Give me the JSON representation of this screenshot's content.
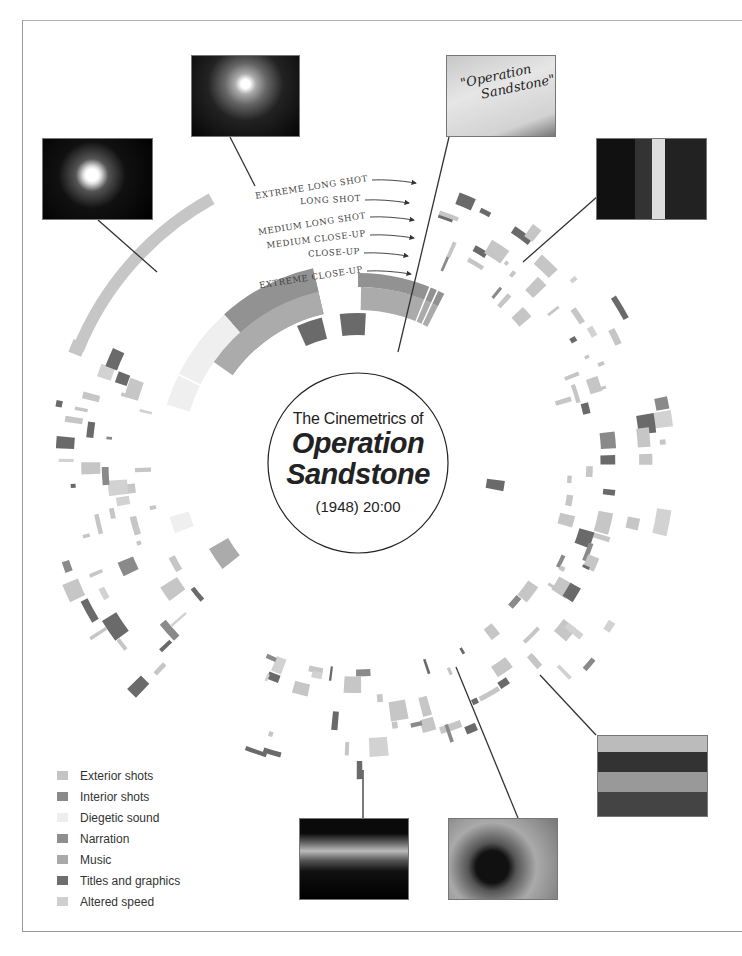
{
  "title": {
    "line1": "The Cinemetrics of",
    "line2": "Operation",
    "line3": "Sandstone",
    "year_duration": "(1948) 20:00"
  },
  "shot_scale_labels": [
    {
      "label": "EXTREME LONG SHOT",
      "x": 406,
      "y": 183
    },
    {
      "label": "LONG SHOT",
      "x": 399,
      "y": 203
    },
    {
      "label": "MEDIUM LONG SHOT",
      "x": 404,
      "y": 220
    },
    {
      "label": "MEDIUM CLOSE-UP",
      "x": 404,
      "y": 238
    },
    {
      "label": "CLOSE-UP",
      "x": 398,
      "y": 256
    },
    {
      "label": "EXTREME CLOSE-UP",
      "x": 401,
      "y": 274
    }
  ],
  "legend": [
    {
      "label": "Exterior shots",
      "color": "#c4c4c4"
    },
    {
      "label": "Interior shots",
      "color": "#8a8a8a"
    },
    {
      "label": "Diegetic sound",
      "color": "#eeeeee"
    },
    {
      "label": "Narration",
      "color": "#8e8e8e"
    },
    {
      "label": "Music",
      "color": "#a9a9a9"
    },
    {
      "label": "Titles and graphics",
      "color": "#6e6e6e"
    },
    {
      "label": "Altered speed",
      "color": "#cfcfcf"
    }
  ],
  "colors": {
    "exterior": "#c6c6c6",
    "interior": "#8a8a8a",
    "diegetic": "#efefef",
    "narration": "#929292",
    "music": "#ababab",
    "titles": "#6a6a6a",
    "speed": "#d2d2d2",
    "line": "#333333"
  },
  "photos": [
    {
      "name": "photo-atomic-blast-night",
      "x": 42,
      "y": 138,
      "w": 111,
      "h": 82,
      "style": "blast"
    },
    {
      "name": "photo-explosion-cloud",
      "x": 191,
      "y": 55,
      "w": 109,
      "h": 82,
      "style": "cloud"
    },
    {
      "name": "photo-title-card",
      "x": 446,
      "y": 55,
      "w": 110,
      "h": 82,
      "style": "card",
      "caption1": "\"Operation",
      "caption2": "Sandstone\""
    },
    {
      "name": "photo-lab-technician",
      "x": 596,
      "y": 138,
      "w": 111,
      "h": 82,
      "style": "lab"
    },
    {
      "name": "photo-crew-on-deck",
      "x": 597,
      "y": 735,
      "w": 111,
      "h": 82,
      "style": "crew"
    },
    {
      "name": "photo-equipment-closeup",
      "x": 448,
      "y": 818,
      "w": 110,
      "h": 82,
      "style": "equip"
    },
    {
      "name": "photo-horizon-sunset",
      "x": 299,
      "y": 818,
      "w": 110,
      "h": 82,
      "style": "horizon"
    }
  ],
  "connector_lines": [
    {
      "x1": 98,
      "y1": 220,
      "x2": 157,
      "y2": 272
    },
    {
      "x1": 230,
      "y1": 137,
      "x2": 255,
      "y2": 186
    },
    {
      "x1": 449,
      "y1": 137,
      "x2": 398,
      "y2": 352
    },
    {
      "x1": 598,
      "y1": 196,
      "x2": 523,
      "y2": 262
    },
    {
      "x1": 596,
      "y1": 735,
      "x2": 540,
      "y2": 675
    },
    {
      "x1": 518,
      "y1": 818,
      "x2": 456,
      "y2": 667
    },
    {
      "x1": 363,
      "y1": 818,
      "x2": 363,
      "y2": 770
    }
  ],
  "chart_data": {
    "type": "radial-timeline",
    "title": "The Cinemetrics of Operation Sandstone",
    "subtitle": "(1948) 20:00",
    "duration": "20:00",
    "center": [
      358,
      463
    ],
    "inner_circle_radius": 90,
    "rings": [
      {
        "name": "Narration",
        "r_in": 153,
        "r_out": 176,
        "segments": [
          [
            0,
            30,
            "narration"
          ],
          [
            31,
            200,
            "narration"
          ],
          [
            200,
            268,
            "narration"
          ],
          [
            268,
            358,
            "narration"
          ]
        ],
        "gaps_deg": [
          22,
          24,
          46,
          50,
          55,
          56,
          70,
          96,
          117,
          147,
          150,
          157,
          166,
          196,
          203,
          256,
          270,
          292,
          302
        ]
      },
      {
        "name": "Titles and graphics",
        "r_in": 130,
        "r_out": 150,
        "segments": [
          [
            346,
            358,
            "titles"
          ],
          [
            0,
            10,
            "titles"
          ],
          [
            98,
            101,
            "titles"
          ]
        ]
      },
      {
        "name": "Music",
        "r_in": 153,
        "r_out": 176,
        "segments": [
          [
            304,
            344,
            "music"
          ],
          [
            2,
            30,
            "music"
          ],
          [
            232,
            240,
            "music"
          ]
        ],
        "offset_band": [
          153,
          176
        ]
      },
      {
        "name": "Diegetic sound",
        "r_in": 178,
        "r_out": 200,
        "segments": [
          [
            286,
            328,
            "diegetic"
          ],
          [
            248,
            255,
            "diegetic"
          ]
        ]
      },
      {
        "name": "Exterior shots (extreme long)",
        "r_in": 296,
        "r_out": 308,
        "segments": [
          [
            293,
            330,
            "exterior"
          ]
        ]
      }
    ],
    "legend": [
      "Exterior shots",
      "Interior shots",
      "Diegetic sound",
      "Narration",
      "Music",
      "Titles and graphics",
      "Altered speed"
    ],
    "shot_scale_radii": {
      "EXTREME LONG SHOT": 300,
      "LONG SHOT": 280,
      "MEDIUM LONG SHOT": 262,
      "MEDIUM CLOSE-UP": 245,
      "CLOSE-UP": 228,
      "EXTREME CLOSE-UP": 210
    }
  }
}
